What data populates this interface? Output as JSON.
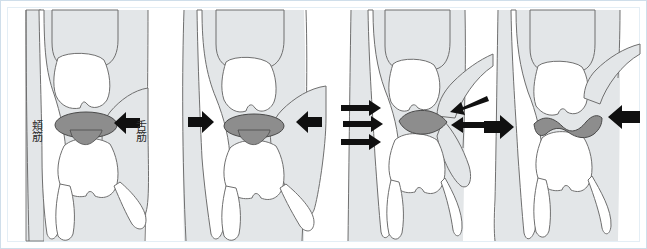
{
  "figure": {
    "panel_count": 4,
    "frame_border_color": "#cfdeea",
    "background_color": "#ffffff"
  },
  "colors": {
    "tissue_fill": "#e3e6e8",
    "tissue_stroke": "#6f6f6f",
    "tooth_fill": "#ffffff",
    "tooth_stroke": "#6f6f6f",
    "bolus_fill": "#8d8d8d",
    "bolus_stroke": "#4a4a4a",
    "arrow_color": "#101010",
    "label_color": "#2b2b2b"
  },
  "labels": {
    "buccinator": "頬筋",
    "tongue": "舌筋"
  },
  "panels": [
    {
      "index": 1,
      "name": "panel-1",
      "caption": "",
      "bolus_shape": "ellipse",
      "arrows": [
        {
          "name": "arrow-right-to-left-1",
          "direction": "left",
          "style": "solid-block"
        }
      ],
      "labels_visible": [
        "頬筋",
        "舌筋"
      ]
    },
    {
      "index": 2,
      "name": "panel-2",
      "caption": "",
      "bolus_shape": "ellipse",
      "arrows": [
        {
          "name": "arrow-left-to-right-1",
          "direction": "right",
          "style": "solid-block"
        },
        {
          "name": "arrow-right-to-left-1",
          "direction": "left",
          "style": "solid-block"
        }
      ],
      "labels_visible": []
    },
    {
      "index": 3,
      "name": "panel-3",
      "caption": "",
      "bolus_shape": "flattened-lens",
      "arrows": [
        {
          "name": "arrow-left-to-right-1",
          "direction": "right",
          "style": "thin-shaft"
        },
        {
          "name": "arrow-left-to-right-2",
          "direction": "right",
          "style": "thin-shaft"
        },
        {
          "name": "arrow-left-to-right-3",
          "direction": "right",
          "style": "thin-shaft"
        },
        {
          "name": "arrow-right-to-left-1",
          "direction": "left",
          "style": "thin-shaft"
        },
        {
          "name": "arrow-right-to-left-2",
          "direction": "left",
          "style": "thin-shaft"
        }
      ],
      "labels_visible": []
    },
    {
      "index": 4,
      "name": "panel-4",
      "caption": "",
      "bolus_shape": "thin-wavy-band",
      "arrows": [
        {
          "name": "arrow-left-to-right-1",
          "direction": "right",
          "style": "solid-block"
        },
        {
          "name": "arrow-right-to-left-1",
          "direction": "left",
          "style": "solid-block"
        }
      ],
      "labels_visible": []
    }
  ]
}
